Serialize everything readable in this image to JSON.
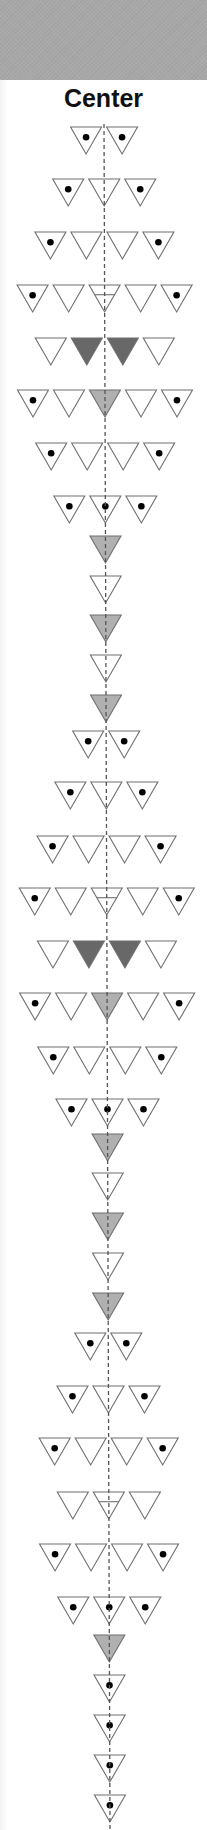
{
  "title": "Center",
  "colors": {
    "header_band": "#a8a8a8",
    "outline": "#6f6f6f",
    "light_fill": "#b0b0b0",
    "dark_fill": "#686868",
    "dot": "#000000",
    "centerline": "#555555"
  },
  "geometry": {
    "tri_width": 31,
    "tri_height": 27,
    "spacing": 36,
    "dot_radius": 3.3,
    "centerline_top_x": 104,
    "centerline_bottom_x": 110,
    "centerline_top_y": 124,
    "centerline_bottom_y": 1830
  },
  "legend_types": {
    "plain": "empty triangle",
    "dot": "triangle with dot",
    "double": "triangle with horizontal line",
    "light": "light gray triangle",
    "dark": "dark gray triangle",
    "dot_light": "dot"
  },
  "rows": [
    {
      "y": 127,
      "cells": [
        "dot",
        "dot"
      ]
    },
    {
      "y": 179,
      "cells": [
        "dot",
        "plain",
        "dot"
      ]
    },
    {
      "y": 232,
      "cells": [
        "dot",
        "plain",
        "plain",
        "dot"
      ]
    },
    {
      "y": 285,
      "cells": [
        "dot",
        "plain",
        "double",
        "plain",
        "dot"
      ]
    },
    {
      "y": 338,
      "cells": [
        "plain",
        "dark",
        "dark",
        "plain"
      ]
    },
    {
      "y": 390,
      "cells": [
        "dot",
        "plain",
        "light",
        "plain",
        "dot"
      ]
    },
    {
      "y": 443,
      "cells": [
        "dot",
        "plain",
        "plain",
        "dot"
      ]
    },
    {
      "y": 496,
      "cells": [
        "dot",
        "dot",
        "dot"
      ]
    },
    {
      "y": 536,
      "cells": [
        "light"
      ]
    },
    {
      "y": 576,
      "cells": [
        "plain"
      ]
    },
    {
      "y": 615,
      "cells": [
        "light"
      ]
    },
    {
      "y": 655,
      "cells": [
        "plain"
      ]
    },
    {
      "y": 695,
      "cells": [
        "light"
      ]
    },
    {
      "y": 731,
      "cells": [
        "dot",
        "dot"
      ]
    },
    {
      "y": 782,
      "cells": [
        "dot",
        "plain",
        "dot"
      ]
    },
    {
      "y": 836,
      "cells": [
        "dot",
        "plain",
        "plain",
        "dot"
      ]
    },
    {
      "y": 888,
      "cells": [
        "dot",
        "plain",
        "double",
        "plain",
        "dot"
      ]
    },
    {
      "y": 941,
      "cells": [
        "plain",
        "dark",
        "dark",
        "plain"
      ]
    },
    {
      "y": 993,
      "cells": [
        "dot",
        "plain",
        "light",
        "plain",
        "dot"
      ]
    },
    {
      "y": 1047,
      "cells": [
        "dot",
        "plain",
        "plain",
        "dot"
      ]
    },
    {
      "y": 1099,
      "cells": [
        "dot",
        "dot",
        "dot"
      ]
    },
    {
      "y": 1134,
      "cells": [
        "light"
      ]
    },
    {
      "y": 1173,
      "cells": [
        "plain"
      ]
    },
    {
      "y": 1213,
      "cells": [
        "light"
      ]
    },
    {
      "y": 1253,
      "cells": [
        "plain"
      ]
    },
    {
      "y": 1293,
      "cells": [
        "light"
      ]
    },
    {
      "y": 1333,
      "cells": [
        "dot",
        "dot"
      ]
    },
    {
      "y": 1386,
      "cells": [
        "dot",
        "plain",
        "dot"
      ]
    },
    {
      "y": 1438,
      "cells": [
        "dot",
        "plain",
        "plain",
        "dot"
      ]
    },
    {
      "y": 1492,
      "cells": [
        "plain",
        "double",
        "plain"
      ]
    },
    {
      "y": 1544,
      "cells": [
        "dot",
        "plain",
        "plain",
        "dot"
      ]
    },
    {
      "y": 1597,
      "cells": [
        "dot",
        "dot",
        "dot"
      ]
    },
    {
      "y": 1635,
      "cells": [
        "light"
      ]
    },
    {
      "y": 1675,
      "cells": [
        "dot"
      ]
    },
    {
      "y": 1715,
      "cells": [
        "dot"
      ]
    },
    {
      "y": 1755,
      "cells": [
        "dot"
      ]
    },
    {
      "y": 1795,
      "cells": [
        "dot"
      ]
    }
  ]
}
